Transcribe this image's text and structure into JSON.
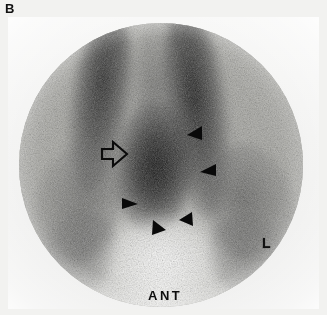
{
  "figure": {
    "panel_letter": "B",
    "modality": "scintigraphy",
    "view": "anterior",
    "background_color": "#f2f2f0",
    "field_shape": "circle"
  },
  "markers": {
    "orientation_label": "ANT",
    "laterality_label": "L",
    "open_arrow": {
      "name": "open-arrow",
      "style": "outline",
      "direction": "right",
      "x": 100,
      "y": 140,
      "width": 26,
      "height": 24
    },
    "arrowheads": [
      {
        "name": "arrowhead-1",
        "style": "solid",
        "direction": "down-left",
        "x": 182,
        "y": 122,
        "size": 15
      },
      {
        "name": "arrowhead-2",
        "style": "solid",
        "direction": "left",
        "x": 195,
        "y": 161,
        "size": 15
      },
      {
        "name": "arrowhead-3",
        "style": "solid",
        "direction": "right",
        "x": 117,
        "y": 194,
        "size": 15
      },
      {
        "name": "arrowhead-4",
        "style": "solid",
        "direction": "up-left",
        "x": 174,
        "y": 209,
        "size": 14
      },
      {
        "name": "arrowhead-5",
        "style": "solid",
        "direction": "up-right",
        "x": 146,
        "y": 216,
        "size": 15
      }
    ]
  },
  "field": {
    "center_x": 163,
    "center_y": 165,
    "radius": 142
  },
  "colors": {
    "paper": "#f2f2f0",
    "field_mid_gray": "#b4b4b0",
    "uptake_dark": "#141414",
    "annotation_black": "#0d0d0d"
  }
}
